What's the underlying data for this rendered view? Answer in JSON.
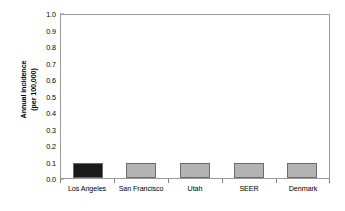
{
  "chart_data": {
    "type": "bar",
    "title": "",
    "xlabel": "",
    "ylabel": "Annual incidence (per 100,000)",
    "ylabel_line1": "Annual incidence",
    "ylabel_line2": "(per 100,000)",
    "categories": [
      "Los Angeles",
      "San Francisco",
      "Utah",
      "SEER",
      "Denmark"
    ],
    "values": [
      0.094,
      0.093,
      0.093,
      0.093,
      0.092
    ],
    "bar_colors": [
      "#1a1a1a",
      "#b3b3b3",
      "#b3b3b3",
      "#b3b3b3",
      "#b3b3b3"
    ],
    "ylim": [
      0.0,
      1.0
    ],
    "ytick_labels": [
      "1.0",
      "0.9",
      "0.8",
      "0.7",
      "0.6",
      "0.5",
      "0.4",
      "0.3",
      "0.2",
      "0.1",
      "0.0"
    ],
    "ytick_values": [
      1.0,
      0.9,
      0.8,
      0.7,
      0.6,
      0.5,
      0.4,
      0.3,
      0.2,
      0.1,
      0.0
    ],
    "grid": false,
    "legend": null,
    "legend_position": "none",
    "frame_color": "#9a9a9a",
    "bar_edge_color": "#6b6b6b",
    "text_color": "#000000",
    "background": "#ffffff"
  }
}
